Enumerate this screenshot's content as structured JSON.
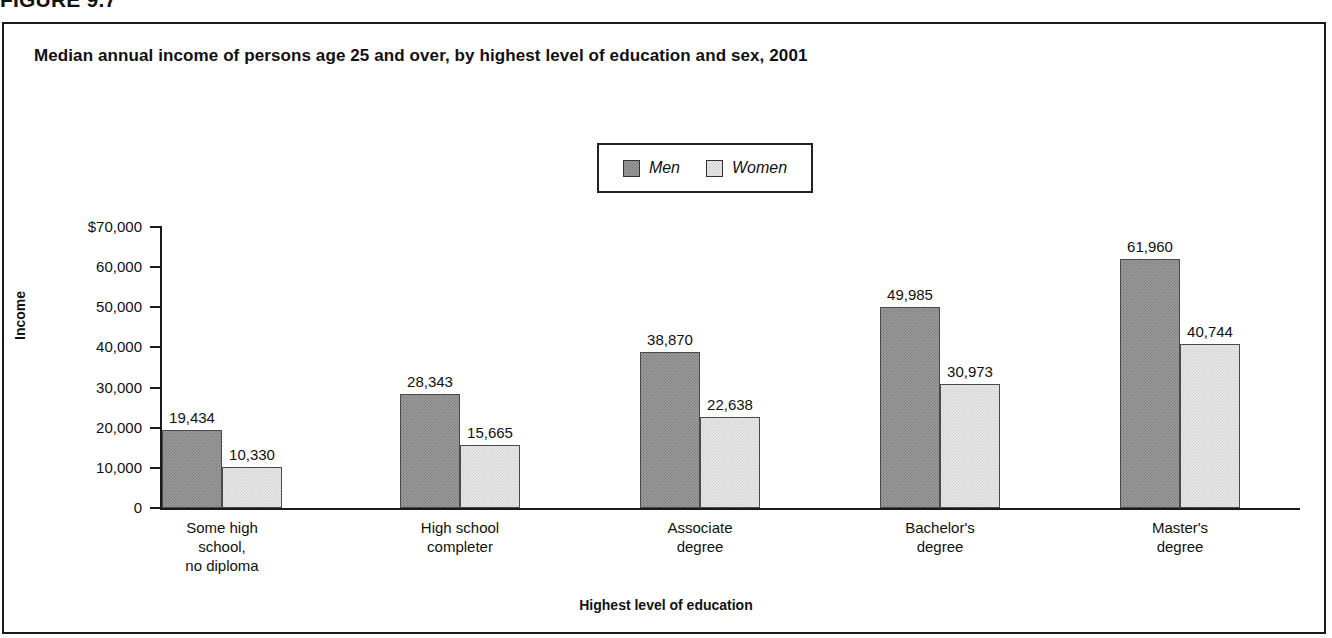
{
  "figure": {
    "header": "FIGURE 9.7",
    "title": "Median annual income of persons age 25 and over, by highest level of education and sex, 2001"
  },
  "legend": {
    "men_label": "Men",
    "women_label": "Women"
  },
  "axes": {
    "y_title": "Income",
    "x_title": "Highest level of education",
    "y_ticks": [
      "$70,000",
      "60,000",
      "50,000",
      "40,000",
      "30,000",
      "20,000",
      "10,000",
      "0"
    ]
  },
  "colors": {
    "men_fill": "#9b9b9b",
    "women_fill": "#e9e9e9",
    "axis": "#1a1a1a",
    "text": "#111111"
  },
  "chart_data": {
    "type": "bar",
    "title": "Median annual income of persons age 25 and over, by highest level of education and sex, 2001",
    "xlabel": "Highest level of education",
    "ylabel": "Income",
    "ylim": [
      0,
      70000
    ],
    "ytick_values": [
      70000,
      60000,
      50000,
      40000,
      30000,
      20000,
      10000,
      0
    ],
    "ytick_labels": [
      "$70,000",
      "60,000",
      "50,000",
      "40,000",
      "30,000",
      "20,000",
      "10,000",
      "0"
    ],
    "grid": false,
    "legend_position": "top-center",
    "categories": [
      "Some high school, no diploma",
      "High school completer",
      "Associate degree",
      "Bachelor's degree",
      "Master's degree"
    ],
    "category_lines": [
      [
        "Some high",
        "school,",
        "no diploma"
      ],
      [
        "High school",
        "completer"
      ],
      [
        "Associate",
        "degree"
      ],
      [
        "Bachelor's",
        "degree"
      ],
      [
        "Master's",
        "degree"
      ]
    ],
    "series": [
      {
        "name": "Men",
        "values": [
          19434,
          28343,
          38870,
          49985,
          61960
        ],
        "labels": [
          "19,434",
          "28,343",
          "38,870",
          "49,985",
          "61,960"
        ]
      },
      {
        "name": "Women",
        "values": [
          10330,
          15665,
          22638,
          30973,
          40744
        ],
        "labels": [
          "10,330",
          "15,665",
          "22,638",
          "30,973",
          "40,744"
        ]
      }
    ]
  }
}
